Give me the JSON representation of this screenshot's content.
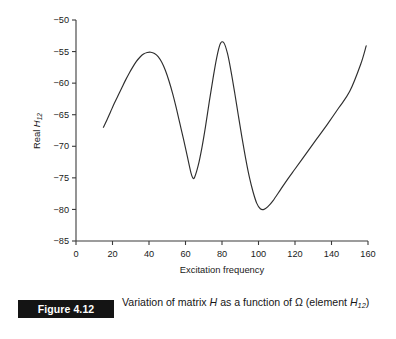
{
  "figure": {
    "number_label": "Figure 4.12",
    "caption_prefix": "Variation of matrix ",
    "caption_symbol_h": "H",
    "caption_middle": " as a function of Ω (element ",
    "caption_symbol_h2": "H",
    "caption_subscript": "12",
    "caption_suffix": ")",
    "caption_full": "Variation of matrix H as a function of Ω (element H12)"
  },
  "chart_data": {
    "type": "line",
    "title": "",
    "xlabel": "Excitation frequency",
    "ylabel": "Real H12",
    "ylabel_prefix": "Real ",
    "ylabel_symbol": "H",
    "ylabel_subscript": "12",
    "xlim": [
      0,
      160
    ],
    "ylim": [
      -85,
      -50
    ],
    "xticks": [
      0,
      20,
      40,
      60,
      80,
      100,
      120,
      140,
      160
    ],
    "xtick_labels": [
      "0",
      "20",
      "40",
      "60",
      "80",
      "100",
      "120",
      "140",
      "160"
    ],
    "yticks": [
      -50,
      -55,
      -60,
      -65,
      -70,
      -75,
      -80,
      -85
    ],
    "ytick_labels": [
      "−50",
      "−55",
      "−60",
      "−65",
      "−70",
      "−75",
      "−80",
      "−85"
    ],
    "grid": false,
    "legend": "none",
    "line_color": "#2e2e2e",
    "axis_color": "#3b3b3b",
    "series": [
      {
        "name": "Real H12",
        "x": [
          15.0,
          17.0,
          19.0,
          21.0,
          23.0,
          25.0,
          27.0,
          29.0,
          31.0,
          33.0,
          35.0,
          37.0,
          39.0,
          41.0,
          43.0,
          45.0,
          47.0,
          49.0,
          51.0,
          53.0,
          55.0,
          57.0,
          59.0,
          61.0,
          63.0,
          64.0,
          65.0,
          67.0,
          69.0,
          71.0,
          73.0,
          75.0,
          77.0,
          79.0,
          81.0,
          83.0,
          85.0,
          87.0,
          89.0,
          91.0,
          93.0,
          95.0,
          97.0,
          99.0,
          101.0,
          103.0,
          105.0,
          108.0,
          112.0,
          116.0,
          120.0,
          126.0,
          132.0,
          138.0,
          144.0,
          150.0,
          156.0,
          159.0
        ],
        "y": [
          -67.0,
          -65.8,
          -64.5,
          -63.2,
          -62.0,
          -60.8,
          -59.6,
          -58.5,
          -57.5,
          -56.6,
          -55.9,
          -55.4,
          -55.15,
          -55.1,
          -55.3,
          -55.8,
          -56.7,
          -58.0,
          -59.7,
          -61.7,
          -64.0,
          -66.5,
          -69.0,
          -71.6,
          -74.2,
          -75.0,
          -74.9,
          -73.0,
          -70.2,
          -66.8,
          -63.0,
          -59.4,
          -56.1,
          -53.8,
          -53.6,
          -55.3,
          -58.2,
          -61.6,
          -65.2,
          -68.7,
          -72.0,
          -74.9,
          -77.2,
          -79.0,
          -79.9,
          -80.0,
          -79.6,
          -78.6,
          -76.9,
          -75.2,
          -73.6,
          -71.2,
          -68.8,
          -66.4,
          -63.9,
          -61.3,
          -57.0,
          -54.1
        ]
      }
    ],
    "annotations": {
      "peak_1": {
        "x": 40,
        "y": -55.1
      },
      "trough_1": {
        "x": 64,
        "y": -75.0
      },
      "peak_2": {
        "x": 79,
        "y": -53.6
      },
      "trough_2": {
        "x": 100,
        "y": -80.0
      },
      "start": {
        "x": 15,
        "y": -67.0
      },
      "end": {
        "x": 159,
        "y": -54.1
      }
    }
  }
}
